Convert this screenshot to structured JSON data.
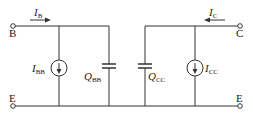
{
  "diagram": {
    "terminals": {
      "base": "B",
      "collector": "C",
      "emitter_left": "E",
      "emitter_right": "E"
    },
    "currents": {
      "base": {
        "sym": "I",
        "sub": "B"
      },
      "collector": {
        "sym": "I",
        "sub": "C"
      }
    },
    "sources": {
      "base_source": {
        "sym": "I",
        "sub": "BB"
      },
      "collector_source": {
        "sym": "I",
        "sub": "CC"
      }
    },
    "capacitors": {
      "base_charge": {
        "sym": "Q",
        "sub": "BB"
      },
      "collector_charge": {
        "sym": "Q",
        "sub": "CC"
      }
    },
    "colors": {
      "line": "#333333",
      "background": "#ffffff"
    }
  }
}
